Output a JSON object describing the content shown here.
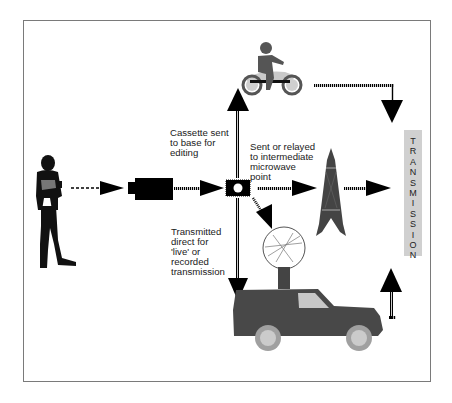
{
  "diagram": {
    "title": "",
    "labels": {
      "cassette": "Cassette sent\nto base for\nediting",
      "relay": "Sent or relayed\nto intermediate\nmicrowave\npoint",
      "direct": "Transmitted\ndirect for\n'live' or\nrecorded\ntransmission"
    },
    "transmission": {
      "text": "TRANSMISSION",
      "letters": [
        "T",
        "R",
        "A",
        "N",
        "S",
        "M",
        "I",
        "S",
        "S",
        "I",
        "O",
        "N"
      ]
    },
    "nodes": [
      {
        "id": "reporter",
        "label": "reporter-with-microphone"
      },
      {
        "id": "camera",
        "label": "video-camera"
      },
      {
        "id": "cassette",
        "label": "video-cassette"
      },
      {
        "id": "motorcycle",
        "label": "motorcycle-courier"
      },
      {
        "id": "tower",
        "label": "microwave-tower"
      },
      {
        "id": "van",
        "label": "outside-broadcast-van-with-dish"
      },
      {
        "id": "transmission",
        "label": "TRANSMISSION"
      }
    ],
    "edges": [
      {
        "from": "reporter",
        "to": "camera",
        "style": "dashed"
      },
      {
        "from": "camera",
        "to": "cassette",
        "style": "dotted"
      },
      {
        "from": "cassette",
        "to": "motorcycle",
        "style": "dotted"
      },
      {
        "from": "cassette",
        "to": "tower",
        "style": "dotted"
      },
      {
        "from": "cassette",
        "to": "van",
        "style": "dotted"
      },
      {
        "from": "cassette",
        "to": "van-dish",
        "style": "dotted"
      },
      {
        "from": "motorcycle",
        "to": "transmission",
        "style": "dotted"
      },
      {
        "from": "tower",
        "to": "transmission",
        "style": "dotted"
      },
      {
        "from": "van",
        "to": "transmission",
        "style": "dotted"
      }
    ],
    "colors": {
      "border": "#7a7a7a",
      "arrow": "#000000",
      "vehicle": "#4a4a4a",
      "wheel": "#a8a8a8",
      "bike_body": "#c9c9c9",
      "tx_box": "#d0d0d0",
      "text": "#1a1a1a"
    }
  }
}
